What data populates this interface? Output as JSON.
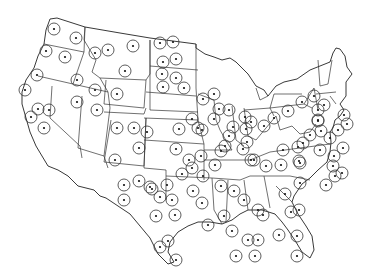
{
  "map": {
    "title": "",
    "region": "Contiguous United States",
    "marker_style": {
      "ring_radius": 6,
      "dot_radius": 1.1,
      "color": "#222222"
    },
    "markers": [
      [
        54,
        29
      ],
      [
        76,
        38
      ],
      [
        46,
        51
      ],
      [
        65,
        57
      ],
      [
        37,
        75
      ],
      [
        25,
        90
      ],
      [
        77,
        80
      ],
      [
        95,
        53
      ],
      [
        108,
        50
      ],
      [
        133,
        46
      ],
      [
        125,
        71
      ],
      [
        117,
        94
      ],
      [
        95,
        90
      ],
      [
        77,
        102
      ],
      [
        97,
        110
      ],
      [
        38,
        109
      ],
      [
        49,
        110
      ],
      [
        31,
        117
      ],
      [
        44,
        128
      ],
      [
        160,
        43
      ],
      [
        173,
        42
      ],
      [
        163,
        62
      ],
      [
        176,
        59
      ],
      [
        162,
        74
      ],
      [
        176,
        78
      ],
      [
        163,
        87
      ],
      [
        184,
        88
      ],
      [
        117,
        128
      ],
      [
        134,
        128
      ],
      [
        147,
        132
      ],
      [
        139,
        148
      ],
      [
        115,
        160
      ],
      [
        179,
        129
      ],
      [
        198,
        128
      ],
      [
        192,
        119
      ],
      [
        202,
        130
      ],
      [
        214,
        119
      ],
      [
        203,
        99
      ],
      [
        214,
        94
      ],
      [
        219,
        109
      ],
      [
        229,
        110
      ],
      [
        233,
        127
      ],
      [
        229,
        136
      ],
      [
        245,
        117
      ],
      [
        246,
        129
      ],
      [
        247,
        142
      ],
      [
        251,
        122
      ],
      [
        264,
        126
      ],
      [
        274,
        118
      ],
      [
        288,
        111
      ],
      [
        302,
        102
      ],
      [
        314,
        96
      ],
      [
        318,
        110
      ],
      [
        324,
        105
      ],
      [
        318,
        120
      ],
      [
        310,
        135
      ],
      [
        298,
        147
      ],
      [
        300,
        163
      ],
      [
        321,
        131
      ],
      [
        320,
        150
      ],
      [
        243,
        149
      ],
      [
        251,
        160
      ],
      [
        266,
        166
      ],
      [
        281,
        165
      ],
      [
        299,
        161
      ],
      [
        303,
        143
      ],
      [
        283,
        150
      ],
      [
        254,
        160
      ],
      [
        225,
        146
      ],
      [
        221,
        151
      ],
      [
        215,
        165
      ],
      [
        201,
        156
      ],
      [
        192,
        168
      ],
      [
        176,
        149
      ],
      [
        189,
        160
      ],
      [
        182,
        174
      ],
      [
        193,
        191
      ],
      [
        221,
        186
      ],
      [
        234,
        191
      ],
      [
        244,
        200
      ],
      [
        258,
        210
      ],
      [
        263,
        215
      ],
      [
        285,
        194
      ],
      [
        300,
        183
      ],
      [
        299,
        210
      ],
      [
        291,
        212
      ],
      [
        279,
        235
      ],
      [
        297,
        236
      ],
      [
        297,
        256
      ],
      [
        326,
        185
      ],
      [
        333,
        166
      ],
      [
        342,
        173
      ],
      [
        335,
        176
      ],
      [
        334,
        156
      ],
      [
        330,
        138
      ],
      [
        343,
        148
      ],
      [
        338,
        130
      ],
      [
        347,
        124
      ],
      [
        344,
        115
      ],
      [
        318,
        121
      ],
      [
        203,
        176
      ],
      [
        202,
        203
      ],
      [
        208,
        225
      ],
      [
        224,
        216
      ],
      [
        248,
        240
      ],
      [
        232,
        231
      ],
      [
        258,
        240
      ],
      [
        236,
        256
      ],
      [
        255,
        256
      ],
      [
        152,
        189
      ],
      [
        150,
        187
      ],
      [
        167,
        185
      ],
      [
        139,
        181
      ],
      [
        124,
        185
      ],
      [
        124,
        200
      ],
      [
        160,
        197
      ],
      [
        172,
        200
      ],
      [
        156,
        216
      ],
      [
        175,
        215
      ],
      [
        168,
        241
      ],
      [
        160,
        247
      ],
      [
        176,
        260
      ]
    ]
  }
}
